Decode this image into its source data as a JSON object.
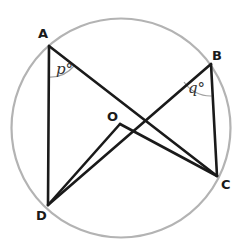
{
  "diagram": {
    "type": "circle-theorem",
    "colors": {
      "circle": "#b3b3b3",
      "lines": "#1a1a1a",
      "arcs": "#a0a0a0",
      "labels": "#1a1a1a"
    },
    "circle": {
      "center": "O"
    },
    "points": [
      {
        "id": "A",
        "label": "A"
      },
      {
        "id": "B",
        "label": "B"
      },
      {
        "id": "C",
        "label": "C"
      },
      {
        "id": "D",
        "label": "D"
      },
      {
        "id": "O",
        "label": "O"
      }
    ],
    "segments": [
      "AD",
      "AC",
      "BD",
      "BC",
      "OD",
      "OC"
    ],
    "angles": [
      {
        "vertex": "A",
        "label": "p°"
      },
      {
        "vertex": "B",
        "label": "q°"
      }
    ]
  }
}
